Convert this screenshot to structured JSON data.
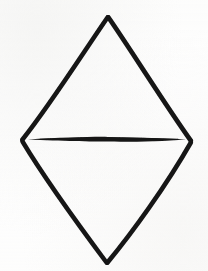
{
  "image": {
    "title": "Hand-drawn rhombus with horizontal median line",
    "medium": "black ink line drawing on white paper",
    "background_color": "#fefefe",
    "ink_color": "#151515",
    "width": 208,
    "height": 271
  },
  "figure": {
    "name": "rhombus-with-median",
    "stroke_color": "#151515",
    "stroke_width": 4.6,
    "vertices": {
      "top": {
        "label": "top apex",
        "x": 108,
        "y": 17
      },
      "left": {
        "label": "left vertex",
        "x": 22,
        "y": 140
      },
      "right": {
        "label": "right vertex",
        "x": 191,
        "y": 141
      },
      "bottom": {
        "label": "bottom apex",
        "x": 107,
        "y": 263
      }
    },
    "outline_path": "M108,17 L22,140 L107,263 L191,141 Z",
    "edges": [
      {
        "name": "upper-left-edge",
        "from": "top",
        "to": "left",
        "path": "M107.5,17.5 C83,53 50,105 22.5,139.5"
      },
      {
        "name": "upper-right-edge",
        "from": "top",
        "to": "right",
        "path": "M108.5,17.5 C133,53 166,106 190.8,140.6"
      },
      {
        "name": "lower-left-edge",
        "from": "left",
        "to": "bottom",
        "path": "M22.5,141.5 C48,184 83,231 106.5,262.5"
      },
      {
        "name": "lower-right-edge",
        "from": "right",
        "to": "bottom",
        "path": "M190.8,142.6 C166,186 132,233 107.5,262.5"
      }
    ],
    "median": {
      "name": "horizontal-median-line",
      "shape": "lens / spindle — tapered to points at both ends, thickest at center",
      "left_x": 28,
      "right_x": 186,
      "center_y": 139,
      "max_thickness": 4.2,
      "path": "M28,139.4 C62,137.6 92,136.6 108,136.9 C132,137.3 162,138.3 186,139.4 C162,141.2 132,142.0 108,141.6 C92,141.4 62,141.0 28,139.4 Z"
    }
  }
}
